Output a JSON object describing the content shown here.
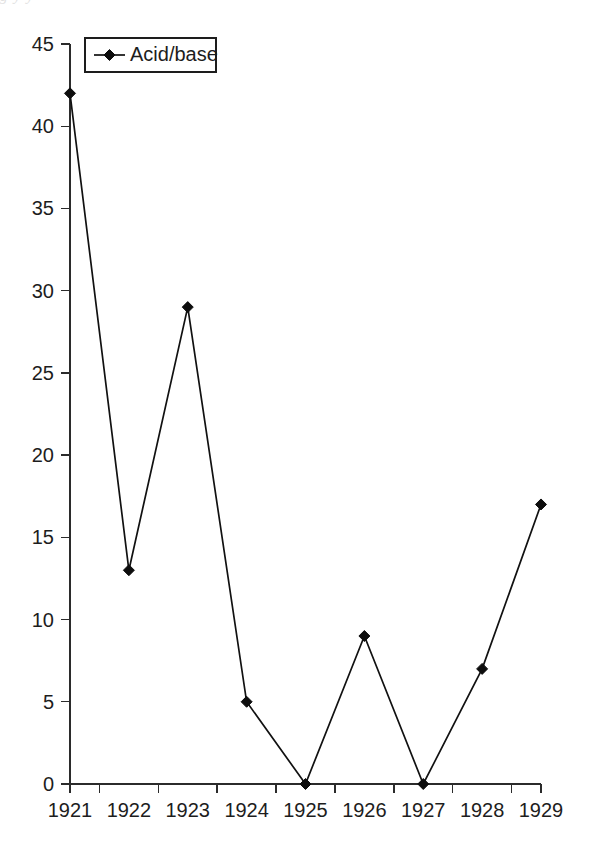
{
  "page": {
    "background_color": "#ffffff",
    "ink_color": "#1a1a1a",
    "scan_artifact_text": "g   y   y"
  },
  "chart_data": {
    "type": "line",
    "title": "",
    "subtitle": "",
    "xlabel": "",
    "ylabel": "",
    "categories": [
      "1921",
      "1922",
      "1923",
      "1924",
      "1925",
      "1926",
      "1927",
      "1928",
      "1929"
    ],
    "series": [
      {
        "name": "Acid/base",
        "values": [
          42,
          13,
          29,
          5,
          0,
          9,
          0,
          7,
          17
        ],
        "marker": "diamond",
        "color": "#111111"
      }
    ],
    "ylim": [
      0,
      45
    ],
    "ytick_values": [
      0,
      5,
      10,
      15,
      20,
      25,
      30,
      35,
      40,
      45
    ],
    "ytick_labels": [
      "0",
      "5",
      "10",
      "15",
      "20",
      "25",
      "30",
      "35",
      "40",
      "45"
    ],
    "xtick_labels": [
      "1921",
      "1922",
      "1923",
      "1924",
      "1925",
      "1926",
      "1927",
      "1928",
      "1929"
    ],
    "grid": false,
    "legend_position": "top-left",
    "legend_entries": [
      "Acid/base"
    ],
    "annotations": []
  },
  "legend": {
    "entry_label": "Acid/base"
  },
  "axes": {
    "y_ticks": [
      {
        "label": "45",
        "value": 45
      },
      {
        "label": "40",
        "value": 40
      },
      {
        "label": "35",
        "value": 35
      },
      {
        "label": "30",
        "value": 30
      },
      {
        "label": "25",
        "value": 25
      },
      {
        "label": "20",
        "value": 20
      },
      {
        "label": "15",
        "value": 15
      },
      {
        "label": "10",
        "value": 10
      },
      {
        "label": "5",
        "value": 5
      },
      {
        "label": "0",
        "value": 0
      }
    ],
    "x_ticks": [
      {
        "label": "1921"
      },
      {
        "label": "1922"
      },
      {
        "label": "1923"
      },
      {
        "label": "1924"
      },
      {
        "label": "1925"
      },
      {
        "label": "1926"
      },
      {
        "label": "1927"
      },
      {
        "label": "1928"
      },
      {
        "label": "1929"
      }
    ]
  }
}
